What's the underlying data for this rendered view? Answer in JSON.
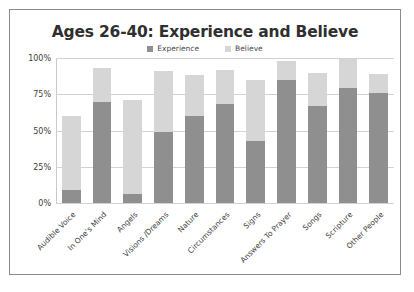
{
  "chart_data": {
    "type": "bar",
    "stacked": true,
    "title": "Ages 26-40: Experience and Believe",
    "xlabel": "",
    "ylabel": "",
    "ylim": [
      0,
      100
    ],
    "yticks": [
      "0%",
      "25%",
      "50%",
      "75%",
      "100%"
    ],
    "ytick_values": [
      0,
      25,
      50,
      75,
      100
    ],
    "grid": true,
    "legend_position": "top-center",
    "colors": {
      "experience": "#8f8f8f",
      "believe": "#d6d6d6",
      "gridline": "#d2d2d2",
      "border": "#8a8a8a",
      "text": "#3d3d3d",
      "title": "#2f2f2f"
    },
    "categories": [
      "Audible Voice",
      "In One's Mind",
      "Angels",
      "Visions /Dreams",
      "Nature",
      "Circumstances",
      "Signs",
      "Answers To Prayer",
      "Songs",
      "Scripture",
      "Other People"
    ],
    "series": [
      {
        "name": "Experience",
        "color": "#8f8f8f",
        "values": [
          9,
          70,
          6,
          49,
          60,
          68,
          43,
          85,
          67,
          79,
          76
        ]
      },
      {
        "name": "Believe",
        "color": "#d6d6d6",
        "values": [
          51,
          23,
          65,
          42,
          28,
          24,
          42,
          13,
          23,
          20,
          13
        ]
      }
    ],
    "totals": [
      60,
      93,
      71,
      91,
      88,
      92,
      85,
      98,
      90,
      99,
      89
    ]
  },
  "legend": {
    "entries": [
      {
        "label": "Experience",
        "color": "#8f8f8f"
      },
      {
        "label": "Believe",
        "color": "#d6d6d6"
      }
    ]
  }
}
